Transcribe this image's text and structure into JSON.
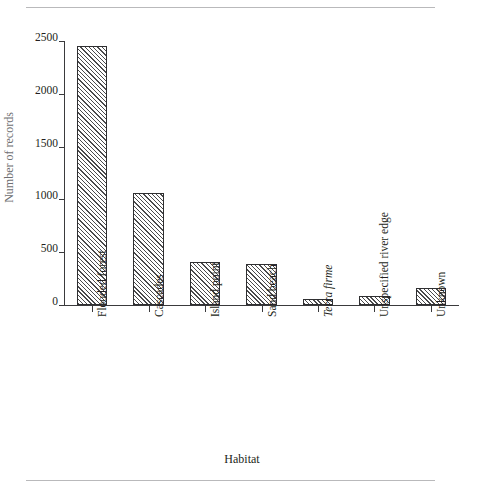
{
  "chart_data": {
    "type": "bar",
    "title": "",
    "subtitle": "",
    "xlabel": "Habitat",
    "ylabel": "Number of records",
    "categories": [
      "Flooded forest",
      "Cascades",
      "Island point",
      "Sand beach",
      "Terra firme",
      "Unspecified river edge",
      "Unknown"
    ],
    "categories_italic": [
      false,
      false,
      false,
      false,
      true,
      false,
      false
    ],
    "values": [
      2450,
      1060,
      410,
      385,
      55,
      85,
      160
    ],
    "ylim": [
      0,
      2500
    ],
    "yticks": [
      0,
      500,
      1000,
      1500,
      2000,
      2500
    ],
    "ytick_labels": [
      "0",
      "500",
      "1000",
      "1500",
      "2000",
      "2500"
    ],
    "xlim_categories": 7,
    "grid": false,
    "legend": false,
    "legend_position": "none",
    "bar_fill": "diagonal-hatch",
    "bar_edge_color": "#2f2f31",
    "bar_hatch_color": "#4a4a4c",
    "background_color": "#ffffff",
    "axis_color": "#3a3a3c",
    "text_color": "#231f20"
  },
  "figure": {
    "rule_color": "#b9b9bb",
    "top_rule": "",
    "bottom_rule": ""
  }
}
